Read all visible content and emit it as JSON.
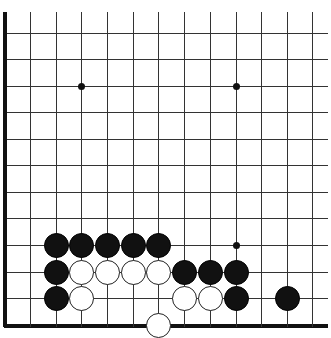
{
  "board": {
    "columns_x": [
      4,
      30,
      56,
      81,
      107,
      133,
      158,
      184,
      210,
      236,
      261,
      287,
      312
    ],
    "rows_y": [
      33,
      59,
      86,
      112,
      139,
      165,
      192,
      218,
      245,
      272,
      298,
      325
    ],
    "top_y": 12,
    "right_x": 328,
    "edges": [
      "left",
      "bottom"
    ],
    "star_points": [
      [
        81,
        86
      ],
      [
        236,
        86
      ],
      [
        236,
        245
      ]
    ],
    "stones": [
      {
        "color": "black",
        "x": 56,
        "y": 245
      },
      {
        "color": "black",
        "x": 81,
        "y": 245
      },
      {
        "color": "black",
        "x": 107,
        "y": 245
      },
      {
        "color": "black",
        "x": 133,
        "y": 245
      },
      {
        "color": "black",
        "x": 158,
        "y": 245
      },
      {
        "color": "black",
        "x": 56,
        "y": 272
      },
      {
        "color": "white",
        "x": 81,
        "y": 272
      },
      {
        "color": "white",
        "x": 107,
        "y": 272
      },
      {
        "color": "white",
        "x": 133,
        "y": 272
      },
      {
        "color": "white",
        "x": 158,
        "y": 272
      },
      {
        "color": "black",
        "x": 184,
        "y": 272
      },
      {
        "color": "black",
        "x": 210,
        "y": 272
      },
      {
        "color": "black",
        "x": 236,
        "y": 272
      },
      {
        "color": "black",
        "x": 56,
        "y": 298
      },
      {
        "color": "white",
        "x": 81,
        "y": 298
      },
      {
        "color": "white",
        "x": 184,
        "y": 298
      },
      {
        "color": "white",
        "x": 210,
        "y": 298
      },
      {
        "color": "black",
        "x": 236,
        "y": 298
      },
      {
        "color": "black",
        "x": 287,
        "y": 298
      },
      {
        "color": "white",
        "x": 158,
        "y": 325
      }
    ]
  }
}
